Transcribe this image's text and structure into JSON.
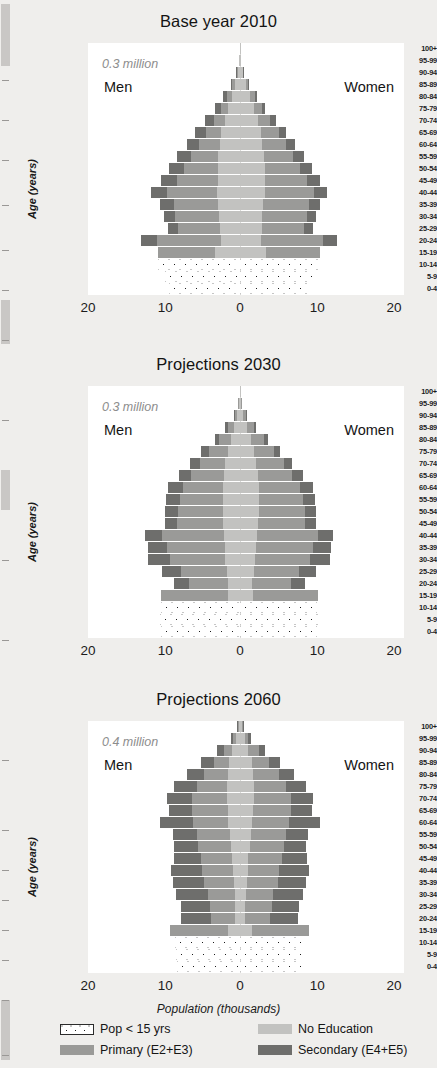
{
  "figure": {
    "x_axis_title": "Population (thousands)",
    "y_axis_title": "Age (years)",
    "x_ticks": [
      "20",
      "10",
      "0",
      "10",
      "20"
    ],
    "age_groups": [
      "100+",
      "95-99",
      "90-94",
      "85-89",
      "80-84",
      "75-79",
      "70-74",
      "65-69",
      "60-64",
      "55-59",
      "50-54",
      "45-49",
      "40-44",
      "35-39",
      "30-34",
      "25-29",
      "20-24",
      "15-19",
      "10-14",
      "5-9",
      "0-4"
    ],
    "men_label": "Men",
    "women_label": "Women"
  },
  "legend": {
    "items": [
      {
        "key": "pop15",
        "label": "Pop < 15 yrs",
        "color": "#ffffff",
        "swatch": "dotted"
      },
      {
        "key": "noedu",
        "label": "No Education",
        "color": "#c2c2c0",
        "swatch": "solid"
      },
      {
        "key": "primary",
        "label": "Primary (E2+E3)",
        "color": "#9a9a98",
        "swatch": "solid"
      },
      {
        "key": "secondary",
        "label": "Secondary (E4+E5)",
        "color": "#6e6e6c",
        "swatch": "solid"
      }
    ]
  },
  "chart_data": [
    {
      "type": "bar",
      "id": "panel-2010",
      "title": "Base year 2010",
      "annotation": "0.3 million",
      "xlabel": "Population (thousands)",
      "ylabel": "Age (years)",
      "xlim": [
        -20,
        20
      ],
      "xticks": [
        -20,
        -10,
        0,
        10,
        20
      ],
      "xticklabels": [
        "20",
        "10",
        "0",
        "10",
        "20"
      ],
      "grid": false,
      "legend_position": "bottom",
      "categories": [
        "100+",
        "95-99",
        "90-94",
        "85-89",
        "80-84",
        "75-79",
        "70-74",
        "65-69",
        "60-64",
        "55-59",
        "50-54",
        "45-49",
        "40-44",
        "35-39",
        "30-34",
        "25-29",
        "20-24",
        "15-19",
        "10-14",
        "5-9",
        "0-4"
      ],
      "stack_order_center_out": [
        "No Education",
        "Primary (E2+E3)",
        "Secondary (E4+E5)"
      ],
      "men": {
        "100+": {
          "No Education": 0.05,
          "Primary (E2+E3)": 0.0,
          "Secondary (E4+E5)": 0.0
        },
        "95-99": {
          "No Education": 0.1,
          "Primary (E2+E3)": 0.0,
          "Secondary (E4+E5)": 0.0
        },
        "90-94": {
          "No Education": 0.3,
          "Primary (E2+E3)": 0.1,
          "Secondary (E4+E5)": 0.1
        },
        "85-89": {
          "No Education": 0.7,
          "Primary (E2+E3)": 0.3,
          "Secondary (E4+E5)": 0.2
        },
        "80-84": {
          "No Education": 1.1,
          "Primary (E2+E3)": 0.6,
          "Secondary (E4+E5)": 0.5
        },
        "75-79": {
          "No Education": 1.5,
          "Primary (E2+E3)": 0.9,
          "Secondary (E4+E5)": 0.8
        },
        "70-74": {
          "No Education": 2.0,
          "Primary (E2+E3)": 1.4,
          "Secondary (E4+E5)": 1.1
        },
        "65-69": {
          "No Education": 2.4,
          "Primary (E2+E3)": 2.0,
          "Secondary (E4+E5)": 1.4
        },
        "60-64": {
          "No Education": 2.6,
          "Primary (E2+E3)": 2.7,
          "Secondary (E4+E5)": 1.6
        },
        "55-59": {
          "No Education": 2.8,
          "Primary (E2+E3)": 3.6,
          "Secondary (E4+E5)": 1.8
        },
        "50-54": {
          "No Education": 2.9,
          "Primary (E2+E3)": 4.4,
          "Secondary (E4+E5)": 1.9
        },
        "45-49": {
          "No Education": 2.9,
          "Primary (E2+E3)": 5.3,
          "Secondary (E4+E5)": 2.0
        },
        "40-44": {
          "No Education": 3.0,
          "Primary (E2+E3)": 6.4,
          "Secondary (E4+E5)": 2.1
        },
        "35-39": {
          "No Education": 2.8,
          "Primary (E2+E3)": 5.8,
          "Secondary (E4+E5)": 1.7
        },
        "30-34": {
          "No Education": 2.7,
          "Primary (E2+E3)": 5.7,
          "Secondary (E4+E5)": 1.5
        },
        "25-29": {
          "No Education": 2.6,
          "Primary (E2+E3)": 5.4,
          "Secondary (E4+E5)": 1.3
        },
        "20-24": {
          "No Education": 2.5,
          "Primary (E2+E3)": 8.2,
          "Secondary (E4+E5)": 2.1
        },
        "15-19": {
          "No Education": 3.3,
          "Primary (E2+E3)": 7.3,
          "Secondary (E4+E5)": 0.0
        },
        "10-14": {
          "Pop < 15 yrs": 10.6
        },
        "5-9": {
          "Pop < 15 yrs": 9.7
        },
        "0-4": {
          "Pop < 15 yrs": 9.2
        }
      },
      "women": {
        "100+": {
          "No Education": 0.05,
          "Primary (E2+E3)": 0.0,
          "Secondary (E4+E5)": 0.0
        },
        "95-99": {
          "No Education": 0.12,
          "Primary (E2+E3)": 0.0,
          "Secondary (E4+E5)": 0.0
        },
        "90-94": {
          "No Education": 0.35,
          "Primary (E2+E3)": 0.1,
          "Secondary (E4+E5)": 0.05
        },
        "85-89": {
          "No Education": 0.8,
          "Primary (E2+E3)": 0.3,
          "Secondary (E4+E5)": 0.1
        },
        "80-84": {
          "No Education": 1.3,
          "Primary (E2+E3)": 0.6,
          "Secondary (E4+E5)": 0.3
        },
        "75-79": {
          "No Education": 1.8,
          "Primary (E2+E3)": 1.0,
          "Secondary (E4+E5)": 0.5
        },
        "70-74": {
          "No Education": 2.3,
          "Primary (E2+E3)": 1.6,
          "Secondary (E4+E5)": 0.8
        },
        "65-69": {
          "No Education": 2.7,
          "Primary (E2+E3)": 2.3,
          "Secondary (E4+E5)": 1.0
        },
        "60-64": {
          "No Education": 2.9,
          "Primary (E2+E3)": 3.0,
          "Secondary (E4+E5)": 1.2
        },
        "55-59": {
          "No Education": 3.1,
          "Primary (E2+E3)": 3.8,
          "Secondary (E4+E5)": 1.4
        },
        "50-54": {
          "No Education": 3.2,
          "Primary (E2+E3)": 4.6,
          "Secondary (E4+E5)": 1.5
        },
        "45-49": {
          "No Education": 3.2,
          "Primary (E2+E3)": 5.5,
          "Secondary (E4+E5)": 1.6
        },
        "40-44": {
          "No Education": 3.2,
          "Primary (E2+E3)": 6.4,
          "Secondary (E4+E5)": 1.7
        },
        "35-39": {
          "No Education": 3.0,
          "Primary (E2+E3)": 5.9,
          "Secondary (E4+E5)": 1.4
        },
        "30-34": {
          "No Education": 2.9,
          "Primary (E2+E3)": 5.8,
          "Secondary (E4+E5)": 1.2
        },
        "25-29": {
          "No Education": 2.8,
          "Primary (E2+E3)": 5.5,
          "Secondary (E4+E5)": 1.1
        },
        "20-24": {
          "No Education": 2.7,
          "Primary (E2+E3)": 8.0,
          "Secondary (E4+E5)": 1.9
        },
        "15-19": {
          "No Education": 3.4,
          "Primary (E2+E3)": 7.0,
          "Secondary (E4+E5)": 0.0
        },
        "10-14": {
          "Pop < 15 yrs": 10.3
        },
        "5-9": {
          "Pop < 15 yrs": 9.5
        },
        "0-4": {
          "Pop < 15 yrs": 9.0
        }
      }
    },
    {
      "type": "bar",
      "id": "panel-2030",
      "title": "Projections 2030",
      "annotation": "0.3 million",
      "xlabel": "Population (thousands)",
      "ylabel": "Age (years)",
      "xlim": [
        -20,
        20
      ],
      "xticks": [
        -20,
        -10,
        0,
        10,
        20
      ],
      "xticklabels": [
        "20",
        "10",
        "0",
        "10",
        "20"
      ],
      "grid": false,
      "legend_position": "bottom",
      "categories": [
        "100+",
        "95-99",
        "90-94",
        "85-89",
        "80-84",
        "75-79",
        "70-74",
        "65-69",
        "60-64",
        "55-59",
        "50-54",
        "45-49",
        "40-44",
        "35-39",
        "30-34",
        "25-29",
        "20-24",
        "15-19",
        "10-14",
        "5-9",
        "0-4"
      ],
      "stack_order_center_out": [
        "No Education",
        "Primary (E2+E3)",
        "Secondary (E4+E5)"
      ],
      "men": {
        "100+": {
          "No Education": 0.05,
          "Primary (E2+E3)": 0.0,
          "Secondary (E4+E5)": 0.0
        },
        "95-99": {
          "No Education": 0.15,
          "Primary (E2+E3)": 0.05,
          "Secondary (E4+E5)": 0.0
        },
        "90-94": {
          "No Education": 0.4,
          "Primary (E2+E3)": 0.3,
          "Secondary (E4+E5)": 0.1
        },
        "85-89": {
          "No Education": 0.8,
          "Primary (E2+E3)": 0.8,
          "Secondary (E4+E5)": 0.3
        },
        "80-84": {
          "No Education": 1.2,
          "Primary (E2+E3)": 1.5,
          "Secondary (E4+E5)": 0.6
        },
        "75-79": {
          "No Education": 1.6,
          "Primary (E2+E3)": 2.4,
          "Secondary (E4+E5)": 1.0
        },
        "70-74": {
          "No Education": 1.9,
          "Primary (E2+E3)": 3.3,
          "Secondary (E4+E5)": 1.3
        },
        "65-69": {
          "No Education": 2.1,
          "Primary (E2+E3)": 4.2,
          "Secondary (E4+E5)": 1.6
        },
        "60-64": {
          "No Education": 2.2,
          "Primary (E2+E3)": 5.2,
          "Secondary (E4+E5)": 1.9
        },
        "55-59": {
          "No Education": 2.2,
          "Primary (E2+E3)": 5.6,
          "Secondary (E4+E5)": 1.8
        },
        "50-54": {
          "No Education": 2.2,
          "Primary (E2+E3)": 5.8,
          "Secondary (E4+E5)": 1.7
        },
        "45-49": {
          "No Education": 2.2,
          "Primary (E2+E3)": 5.9,
          "Secondary (E4+E5)": 1.6
        },
        "40-44": {
          "No Education": 2.1,
          "Primary (E2+E3)": 8.0,
          "Secondary (E4+E5)": 2.2
        },
        "35-39": {
          "No Education": 2.0,
          "Primary (E2+E3)": 7.4,
          "Secondary (E4+E5)": 2.5
        },
        "30-34": {
          "No Education": 1.9,
          "Primary (E2+E3)": 7.2,
          "Secondary (E4+E5)": 2.8
        },
        "25-29": {
          "No Education": 1.7,
          "Primary (E2+E3)": 6.0,
          "Secondary (E4+E5)": 2.4
        },
        "20-24": {
          "No Education": 1.5,
          "Primary (E2+E3)": 5.1,
          "Secondary (E4+E5)": 1.9
        },
        "15-19": {
          "No Education": 1.6,
          "Primary (E2+E3)": 8.6,
          "Secondary (E4+E5)": 0.0
        },
        "10-14": {
          "Pop < 15 yrs": 10.2
        },
        "5-9": {
          "Pop < 15 yrs": 10.4
        },
        "0-4": {
          "Pop < 15 yrs": 10.2
        }
      },
      "women": {
        "100+": {
          "No Education": 0.05,
          "Primary (E2+E3)": 0.0,
          "Secondary (E4+E5)": 0.0
        },
        "95-99": {
          "No Education": 0.18,
          "Primary (E2+E3)": 0.06,
          "Secondary (E4+E5)": 0.0
        },
        "90-94": {
          "No Education": 0.45,
          "Primary (E2+E3)": 0.35,
          "Secondary (E4+E5)": 0.1
        },
        "85-89": {
          "No Education": 0.9,
          "Primary (E2+E3)": 0.9,
          "Secondary (E4+E5)": 0.25
        },
        "80-84": {
          "No Education": 1.4,
          "Primary (E2+E3)": 1.7,
          "Secondary (E4+E5)": 0.5
        },
        "75-79": {
          "No Education": 1.8,
          "Primary (E2+E3)": 2.6,
          "Secondary (E4+E5)": 0.8
        },
        "70-74": {
          "No Education": 2.1,
          "Primary (E2+E3)": 3.6,
          "Secondary (E4+E5)": 1.1
        },
        "65-69": {
          "No Education": 2.3,
          "Primary (E2+E3)": 4.5,
          "Secondary (E4+E5)": 1.4
        },
        "60-64": {
          "No Education": 2.4,
          "Primary (E2+E3)": 5.4,
          "Secondary (E4+E5)": 1.6
        },
        "55-59": {
          "No Education": 2.4,
          "Primary (E2+E3)": 5.8,
          "Secondary (E4+E5)": 1.5
        },
        "50-54": {
          "No Education": 2.4,
          "Primary (E2+E3)": 6.0,
          "Secondary (E4+E5)": 1.4
        },
        "45-49": {
          "No Education": 2.3,
          "Primary (E2+E3)": 6.1,
          "Secondary (E4+E5)": 1.4
        },
        "40-44": {
          "No Education": 2.2,
          "Primary (E2+E3)": 7.9,
          "Secondary (E4+E5)": 2.0
        },
        "35-39": {
          "No Education": 2.1,
          "Primary (E2+E3)": 7.3,
          "Secondary (E4+E5)": 2.4
        },
        "30-34": {
          "No Education": 2.0,
          "Primary (E2+E3)": 7.1,
          "Secondary (E4+E5)": 2.6
        },
        "25-29": {
          "No Education": 1.8,
          "Primary (E2+E3)": 5.9,
          "Secondary (E4+E5)": 2.2
        },
        "20-24": {
          "No Education": 1.6,
          "Primary (E2+E3)": 5.0,
          "Secondary (E4+E5)": 1.8
        },
        "15-19": {
          "No Education": 1.7,
          "Primary (E2+E3)": 8.4,
          "Secondary (E4+E5)": 0.0
        },
        "10-14": {
          "Pop < 15 yrs": 10.0
        },
        "5-9": {
          "Pop < 15 yrs": 10.2
        },
        "0-4": {
          "Pop < 15 yrs": 10.0
        }
      }
    },
    {
      "type": "bar",
      "id": "panel-2060",
      "title": "Projections 2060",
      "annotation": "0.4 million",
      "xlabel": "Population (thousands)",
      "ylabel": "Age (years)",
      "xlim": [
        -20,
        20
      ],
      "xticks": [
        -20,
        -10,
        0,
        10,
        20
      ],
      "xticklabels": [
        "20",
        "10",
        "0",
        "10",
        "20"
      ],
      "grid": false,
      "legend_position": "bottom",
      "categories": [
        "100+",
        "95-99",
        "90-94",
        "85-89",
        "80-84",
        "75-79",
        "70-74",
        "65-69",
        "60-64",
        "55-59",
        "50-54",
        "45-49",
        "40-44",
        "35-39",
        "30-34",
        "25-29",
        "20-24",
        "15-19",
        "10-14",
        "5-9",
        "0-4"
      ],
      "stack_order_center_out": [
        "No Education",
        "Primary (E2+E3)",
        "Secondary (E4+E5)"
      ],
      "men": {
        "100+": {
          "No Education": 0.2,
          "Primary (E2+E3)": 0.1,
          "Secondary (E4+E5)": 0.05
        },
        "95-99": {
          "No Education": 0.5,
          "Primary (E2+E3)": 0.4,
          "Secondary (E4+E5)": 0.3
        },
        "90-94": {
          "No Education": 1.0,
          "Primary (E2+E3)": 1.1,
          "Secondary (E4+E5)": 0.9
        },
        "85-89": {
          "No Education": 1.4,
          "Primary (E2+E3)": 2.0,
          "Secondary (E4+E5)": 1.6
        },
        "80-84": {
          "No Education": 1.6,
          "Primary (E2+E3)": 3.0,
          "Secondary (E4+E5)": 2.3
        },
        "75-79": {
          "No Education": 1.7,
          "Primary (E2+E3)": 3.9,
          "Secondary (E4+E5)": 2.9
        },
        "70-74": {
          "No Education": 1.7,
          "Primary (E2+E3)": 4.5,
          "Secondary (E4+E5)": 3.3
        },
        "65-69": {
          "No Education": 1.6,
          "Primary (E2+E3)": 4.6,
          "Secondary (E4+E5)": 3.0
        },
        "60-64": {
          "No Education": 1.5,
          "Primary (E2+E3)": 4.6,
          "Secondary (E4+E5)": 4.3
        },
        "55-59": {
          "No Education": 1.3,
          "Primary (E2+E3)": 4.3,
          "Secondary (E4+E5)": 3.1
        },
        "50-54": {
          "No Education": 1.2,
          "Primary (E2+E3)": 4.2,
          "Secondary (E4+E5)": 3.1
        },
        "45-49": {
          "No Education": 1.0,
          "Primary (E2+E3)": 4.1,
          "Secondary (E4+E5)": 3.5
        },
        "40-44": {
          "No Education": 0.9,
          "Primary (E2+E3)": 4.0,
          "Secondary (E4+E5)": 4.0
        },
        "35-39": {
          "No Education": 0.8,
          "Primary (E2+E3)": 3.9,
          "Secondary (E4+E5)": 4.0
        },
        "30-34": {
          "No Education": 0.7,
          "Primary (E2+E3)": 3.4,
          "Secondary (E4+E5)": 4.2
        },
        "25-29": {
          "No Education": 0.6,
          "Primary (E2+E3)": 3.3,
          "Secondary (E4+E5)": 3.7
        },
        "20-24": {
          "No Education": 0.6,
          "Primary (E2+E3)": 3.1,
          "Secondary (E4+E5)": 3.9
        },
        "15-19": {
          "No Education": 1.5,
          "Primary (E2+E3)": 7.6,
          "Secondary (E4+E5)": 0.0
        },
        "10-14": {
          "Pop < 15 yrs": 8.4
        },
        "5-9": {
          "Pop < 15 yrs": 8.3
        },
        "0-4": {
          "Pop < 15 yrs": 8.2
        }
      },
      "women": {
        "100+": {
          "No Education": 0.25,
          "Primary (E2+E3)": 0.15,
          "Secondary (E4+E5)": 0.05
        },
        "95-99": {
          "No Education": 0.6,
          "Primary (E2+E3)": 0.5,
          "Secondary (E4+E5)": 0.3
        },
        "90-94": {
          "No Education": 1.1,
          "Primary (E2+E3)": 1.3,
          "Secondary (E4+E5)": 0.8
        },
        "85-89": {
          "No Education": 1.5,
          "Primary (E2+E3)": 2.3,
          "Secondary (E4+E5)": 1.4
        },
        "80-84": {
          "No Education": 1.7,
          "Primary (E2+E3)": 3.3,
          "Secondary (E4+E5)": 2.0
        },
        "75-79": {
          "No Education": 1.8,
          "Primary (E2+E3)": 4.2,
          "Secondary (E4+E5)": 2.5
        },
        "70-74": {
          "No Education": 1.8,
          "Primary (E2+E3)": 4.8,
          "Secondary (E4+E5)": 2.9
        },
        "65-69": {
          "No Education": 1.7,
          "Primary (E2+E3)": 4.9,
          "Secondary (E4+E5)": 2.7
        },
        "60-64": {
          "No Education": 1.6,
          "Primary (E2+E3)": 4.8,
          "Secondary (E4+E5)": 4.0
        },
        "55-59": {
          "No Education": 1.4,
          "Primary (E2+E3)": 4.5,
          "Secondary (E4+E5)": 2.9
        },
        "50-54": {
          "No Education": 1.3,
          "Primary (E2+E3)": 4.4,
          "Secondary (E4+E5)": 2.9
        },
        "45-49": {
          "No Education": 1.1,
          "Primary (E2+E3)": 4.3,
          "Secondary (E4+E5)": 3.3
        },
        "40-44": {
          "No Education": 1.0,
          "Primary (E2+E3)": 4.1,
          "Secondary (E4+E5)": 3.8
        },
        "35-39": {
          "No Education": 0.9,
          "Primary (E2+E3)": 4.0,
          "Secondary (E4+E5)": 3.7
        },
        "30-34": {
          "No Education": 0.8,
          "Primary (E2+E3)": 3.5,
          "Secondary (E4+E5)": 3.9
        },
        "25-29": {
          "No Education": 0.7,
          "Primary (E2+E3)": 3.4,
          "Secondary (E4+E5)": 3.5
        },
        "20-24": {
          "No Education": 0.7,
          "Primary (E2+E3)": 3.2,
          "Secondary (E4+E5)": 3.6
        },
        "15-19": {
          "No Education": 1.6,
          "Primary (E2+E3)": 7.3,
          "Secondary (E4+E5)": 0.0
        },
        "10-14": {
          "Pop < 15 yrs": 8.2
        },
        "5-9": {
          "Pop < 15 yrs": 8.1
        },
        "0-4": {
          "Pop < 15 yrs": 8.0
        }
      }
    }
  ]
}
